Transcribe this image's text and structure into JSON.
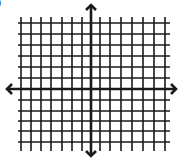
{
  "diagram": {
    "type": "coordinate-plane",
    "corner_label": "0",
    "colors": {
      "line": "#1a1a1a",
      "background": "#ffffff"
    },
    "grid": {
      "vertical_lines_x": [
        21,
        31,
        41,
        51,
        62,
        72,
        82,
        100,
        110,
        121,
        132,
        143,
        154,
        165
      ],
      "horizontal_lines_y": [
        23,
        34,
        45,
        56,
        67,
        78,
        100,
        111,
        121,
        131,
        142
      ],
      "x_extent": [
        18,
        170
      ],
      "y_extent": [
        17,
        151
      ]
    },
    "axes": {
      "x_axis": {
        "y": 89,
        "x_start": 7,
        "x_end": 176,
        "arrows": [
          "left",
          "right"
        ]
      },
      "y_axis": {
        "x": 91,
        "y_start": 5,
        "y_end": 156,
        "arrows": [
          "up",
          "down"
        ]
      }
    }
  }
}
